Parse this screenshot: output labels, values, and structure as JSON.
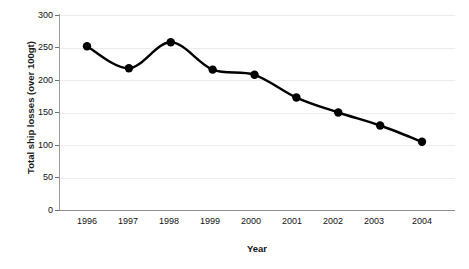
{
  "chart_data": {
    "type": "line",
    "title": "",
    "xlabel": "Year",
    "ylabel": "Total ship losses (over 100gt)",
    "categories": [
      "1996",
      "1997",
      "1998",
      "1999",
      "2000",
      "2001",
      "2002",
      "2003",
      "2004"
    ],
    "x": [
      1996,
      1997,
      1998,
      1999,
      2000,
      2001,
      2002,
      2003,
      2004
    ],
    "values": [
      252,
      218,
      258,
      216,
      208,
      173,
      150,
      130,
      105
    ],
    "series": [
      {
        "name": "Total ship losses (over 100gt)",
        "values": [
          252,
          218,
          258,
          216,
          208,
          173,
          150,
          130,
          105
        ]
      }
    ],
    "ylim": [
      0,
      300
    ],
    "yticks": [
      0,
      50,
      100,
      150,
      200,
      250,
      300
    ],
    "ytick_labels": [
      "0",
      "50",
      "100",
      "150",
      "200",
      "250",
      "300"
    ],
    "xlim": [
      1996,
      2004
    ],
    "grid": true,
    "grid_axis": "y",
    "legend": false,
    "legend_position": "none",
    "marker": "filled-circle",
    "line_color": "#000000",
    "marker_color": "#000000",
    "gridline_color": "#ECECED",
    "axis_color": "#8F8F91",
    "annotations": []
  },
  "axes": {
    "y_title": "Total ship losses (over 100gt)",
    "x_title": "Year",
    "y_tick_labels": [
      "300",
      "250",
      "200",
      "150",
      "100",
      "50",
      "0"
    ],
    "x_tick_labels": [
      "1996",
      "1997",
      "1998",
      "1999",
      "2000",
      "2001",
      "2002",
      "2003",
      "2004"
    ]
  }
}
